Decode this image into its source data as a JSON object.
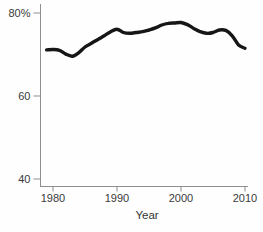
{
  "chart_data": {
    "type": "line",
    "title": "",
    "xlabel": "Year",
    "ylabel": "",
    "unit": "%",
    "x": [
      1979,
      1980,
      1981,
      1982,
      1983,
      1984,
      1985,
      1986,
      1987,
      1988,
      1989,
      1990,
      1991,
      1992,
      1993,
      1994,
      1995,
      1996,
      1997,
      1998,
      1999,
      2000,
      2001,
      2002,
      2003,
      2004,
      2005,
      2006,
      2007,
      2008,
      2009,
      2010
    ],
    "values": [
      71.1,
      71.2,
      71.0,
      70.1,
      69.6,
      70.4,
      71.8,
      72.7,
      73.6,
      74.5,
      75.5,
      76.1,
      75.3,
      75.1,
      75.3,
      75.5,
      75.9,
      76.4,
      77.1,
      77.5,
      77.6,
      77.7,
      77.2,
      76.3,
      75.5,
      75.1,
      75.3,
      75.9,
      75.8,
      74.5,
      72.3,
      71.5
    ],
    "x_ticks": [
      1980,
      1990,
      2000,
      2010
    ],
    "x_tick_labels": [
      "1980",
      "1990",
      "2000",
      "2010"
    ],
    "y_ticks": [
      40,
      60,
      80
    ],
    "y_tick_labels": [
      "40",
      "60",
      "80%"
    ],
    "xlim": [
      1978,
      2010.5
    ],
    "ylim": [
      38,
      81
    ],
    "grid": false,
    "legend": null,
    "line_color": "#161616",
    "axis_color": "#8f8f8f",
    "text_color": "#3a3a3a"
  }
}
